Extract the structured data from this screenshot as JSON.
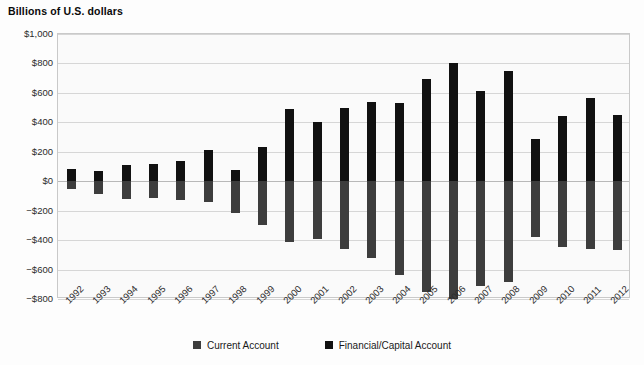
{
  "chart_data": {
    "type": "bar",
    "title": "Billions of U.S. dollars",
    "subtitle": "",
    "xlabel": "",
    "ylabel": "",
    "ylim": [
      -800,
      1000
    ],
    "ytick_step": 200,
    "ytick_labels": [
      "$1,000",
      "$800",
      "$600",
      "$400",
      "$200",
      "$0",
      "−$200",
      "−$400",
      "−$600",
      "−$800"
    ],
    "ytick_values": [
      1000,
      800,
      600,
      400,
      200,
      0,
      -200,
      -400,
      -600,
      -800
    ],
    "grid": true,
    "stacked": false,
    "legend_position": "bottom-center",
    "categories": [
      "1992",
      "1993",
      "1994",
      "1995",
      "1996",
      "1997",
      "1998",
      "1999",
      "2000",
      "2001",
      "2002",
      "2003",
      "2004",
      "2005",
      "2006",
      "2007",
      "2008",
      "2009",
      "2010",
      "2011",
      "2012"
    ],
    "series": [
      {
        "name": "Current Account",
        "color": "#3d3d3d",
        "values": [
          -50,
          -85,
          -120,
          -115,
          -125,
          -140,
          -215,
          -300,
          -415,
          -395,
          -460,
          -520,
          -640,
          -750,
          -800,
          -715,
          -685,
          -380,
          -450,
          -460,
          -470
        ]
      },
      {
        "name": "Financial/Capital Account",
        "color": "#111111",
        "values": [
          80,
          70,
          110,
          120,
          140,
          215,
          75,
          230,
          490,
          405,
          500,
          535,
          530,
          695,
          805,
          615,
          750,
          285,
          440,
          565,
          450
        ]
      }
    ]
  },
  "legend": {
    "items": [
      {
        "label": "Current Account",
        "color": "#3d3d3d",
        "swatch": "legend-swatch-current-account"
      },
      {
        "label": "Financial/Capital Account",
        "color": "#111111",
        "swatch": "legend-swatch-financial-capital-account"
      }
    ]
  },
  "colors": {
    "plot_background": "#fafafa",
    "page_background": "#ffffff",
    "gridline": "#d6d6d6",
    "zero_line": "#b8b8b8",
    "axis_border": "#c9c9c9",
    "text": "#2b2b2b",
    "title_text": "#0a0a0a"
  }
}
